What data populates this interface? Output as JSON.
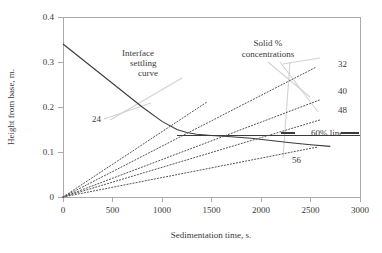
{
  "chart_data": {
    "type": "line",
    "title": "",
    "xlabel": "Sedimentation time, s.",
    "ylabel": "Height from base, m.",
    "xlim": [
      0,
      3000
    ],
    "ylim": [
      0,
      0.4
    ],
    "xticks": [
      0,
      500,
      1000,
      1500,
      2000,
      2500,
      3000
    ],
    "xticklabels": [
      "0",
      "500",
      "1000",
      "1500",
      "2000",
      "2500",
      "3000"
    ],
    "yticks": [
      0,
      0.1,
      0.2,
      0.3,
      0.4
    ],
    "yticklabels": [
      "0",
      "0.1",
      "0.2",
      "0.3",
      "0.4"
    ],
    "grid": false,
    "legend_position": "inline-annotations",
    "series": [
      {
        "name": "Interface settling curve",
        "style": "solid",
        "color": "#3b3b3b",
        "points": [
          [
            0,
            0.34
          ],
          [
            200,
            0.305
          ],
          [
            400,
            0.27
          ],
          [
            600,
            0.235
          ],
          [
            800,
            0.2
          ],
          [
            1000,
            0.168
          ],
          [
            1150,
            0.15
          ],
          [
            1250,
            0.1435
          ],
          [
            1350,
            0.1395
          ],
          [
            1500,
            0.1365
          ],
          [
            1700,
            0.134
          ],
          [
            1900,
            0.1305
          ],
          [
            2100,
            0.1255
          ],
          [
            2300,
            0.1205
          ],
          [
            2500,
            0.116
          ],
          [
            2700,
            0.1125
          ]
        ]
      },
      {
        "name": "60% line",
        "style": "solid-horizontal",
        "color": "#3b3b3b",
        "points": [
          [
            1150,
            0.137
          ],
          [
            3000,
            0.137
          ]
        ]
      },
      {
        "name": "24",
        "style": "dotted",
        "color": "#555555",
        "points": [
          [
            0,
            0
          ],
          [
            1450,
            0.2105
          ]
        ]
      },
      {
        "name": "32",
        "style": "dotted",
        "color": "#555555",
        "points": [
          [
            0,
            0
          ],
          [
            2560,
            0.289
          ]
        ]
      },
      {
        "name": "40",
        "style": "dotted",
        "color": "#555555",
        "points": [
          [
            0,
            0
          ],
          [
            2590,
            0.2155
          ]
        ]
      },
      {
        "name": "48",
        "style": "dotted",
        "color": "#555555",
        "points": [
          [
            0,
            0
          ],
          [
            2600,
            0.1715
          ]
        ]
      },
      {
        "name": "56",
        "style": "dotted",
        "color": "#555555",
        "points": [
          [
            0,
            0
          ],
          [
            2570,
            0.111
          ]
        ]
      }
    ],
    "series_labels": [
      {
        "text": "24",
        "x_px": 92,
        "y_px": 122
      },
      {
        "text": "32",
        "x_px": 338,
        "y_px": 67
      },
      {
        "text": "40",
        "x_px": 338,
        "y_px": 94
      },
      {
        "text": "48",
        "x_px": 338,
        "y_px": 113
      },
      {
        "text": "56",
        "x_px": 292,
        "y_px": 163
      },
      {
        "text": "60% line",
        "x_px": 311,
        "y_px": 136
      }
    ],
    "annotations": [
      {
        "text": "Interface",
        "x_px": 122,
        "y_px": 56
      },
      {
        "text": "settling",
        "x_px": 130,
        "y_px": 66
      },
      {
        "text": "curve",
        "x_px": 138,
        "y_px": 76
      },
      {
        "text": "Solid %",
        "x_px": 268,
        "y_px": 46
      },
      {
        "text": "concentrations",
        "x_px": 268,
        "y_px": 57
      }
    ]
  }
}
